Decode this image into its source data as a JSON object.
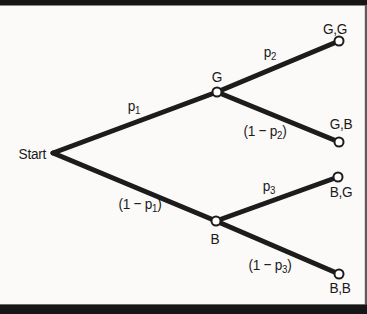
{
  "figure": {
    "type": "probability-tree",
    "width": 367,
    "height": 314,
    "colors": {
      "background": "#fbfaf8",
      "band": "#161616",
      "band_edge": "#6a6a6a",
      "right_strip": "#3f3f3f",
      "line": "#1c1c1c",
      "text": "#1b1b1b",
      "node_fill": "#ffffff",
      "node_stroke": "#1c1c1c"
    },
    "line_width": 5,
    "node_radius": 4.5,
    "node_stroke_width": 2,
    "nodes": [
      {
        "id": "start",
        "x": 53,
        "y": 153,
        "circle": false,
        "label": "Start",
        "label_x": 46,
        "label_y": 159,
        "anchor": "end",
        "name": "start-label"
      },
      {
        "id": "G",
        "x": 217,
        "y": 92,
        "circle": true,
        "label": "G",
        "label_x": 217,
        "label_y": 82,
        "anchor": "middle",
        "name": "node-label-G"
      },
      {
        "id": "B",
        "x": 216,
        "y": 221,
        "circle": true,
        "label": "B",
        "label_x": 215,
        "label_y": 244,
        "anchor": "middle",
        "name": "node-label-B"
      },
      {
        "id": "GG",
        "x": 339,
        "y": 41,
        "circle": true,
        "label": "G,G",
        "label_x": 335,
        "label_y": 34,
        "anchor": "middle",
        "name": "outcome-label-GG"
      },
      {
        "id": "GB",
        "x": 339,
        "y": 142,
        "circle": true,
        "label": "G,B",
        "label_x": 341,
        "label_y": 129,
        "anchor": "middle",
        "name": "outcome-label-GB"
      },
      {
        "id": "BG",
        "x": 338,
        "y": 177,
        "circle": true,
        "label": "B,G",
        "label_x": 341,
        "label_y": 197,
        "anchor": "middle",
        "name": "outcome-label-BG"
      },
      {
        "id": "BB",
        "x": 339,
        "y": 274,
        "circle": true,
        "label": "B,B",
        "label_x": 340,
        "label_y": 293,
        "anchor": "middle",
        "name": "outcome-label-BB"
      }
    ],
    "edges": [
      {
        "from": "start",
        "to": "G",
        "label": "p₁",
        "label_x": 134,
        "label_y": 111
      },
      {
        "from": "start",
        "to": "B",
        "label": "(1 − p₁)",
        "label_x": 140,
        "label_y": 209
      },
      {
        "from": "G",
        "to": "GG",
        "label": "p₂",
        "label_x": 270,
        "label_y": 57
      },
      {
        "from": "G",
        "to": "GB",
        "label": "(1 − p₂)",
        "label_x": 265,
        "label_y": 136
      },
      {
        "from": "B",
        "to": "BG",
        "label": "p₃",
        "label_x": 269,
        "label_y": 191
      },
      {
        "from": "B",
        "to": "BB",
        "label": "(1 − p₃)",
        "label_x": 270,
        "label_y": 270
      }
    ],
    "bands": {
      "top": {
        "y": 0,
        "height": 5.5
      },
      "bottom": {
        "y": 305,
        "height": 9
      }
    }
  }
}
